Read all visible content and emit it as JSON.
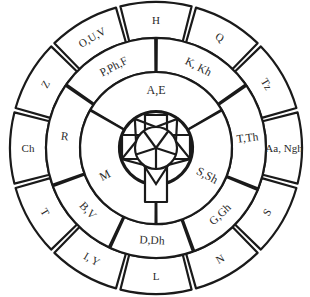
{
  "diagram": {
    "type": "concentric-letter-wheel",
    "center": {
      "x": 156,
      "y": 148
    },
    "colors": {
      "stroke": "#1a1a1a",
      "fill": "#ffffff",
      "text": "#2a2a2a"
    },
    "emblem": {
      "description": "cross over circle with pentagon-star pattern"
    },
    "inner_ring": {
      "segments": [
        {
          "label": "A,E"
        },
        {
          "label": "S,Sh"
        },
        {
          "label": "M"
        }
      ]
    },
    "middle_ring": {
      "segments": [
        {
          "label": "K, Kh"
        },
        {
          "label": "T,Th"
        },
        {
          "label": "G,Gh"
        },
        {
          "label": "D,Dh"
        },
        {
          "label": "B,V"
        },
        {
          "label": "R"
        },
        {
          "label": "P,Ph,F"
        }
      ]
    },
    "outer_ring": {
      "segments": [
        {
          "label": "H"
        },
        {
          "label": "Q"
        },
        {
          "label": "Tz"
        },
        {
          "label": "Aa, Ngh"
        },
        {
          "label": "S"
        },
        {
          "label": "N"
        },
        {
          "label": "L"
        },
        {
          "label": "I, Y"
        },
        {
          "label": "T"
        },
        {
          "label": "Ch"
        },
        {
          "label": "Z"
        },
        {
          "label": "O,U,V"
        }
      ]
    }
  }
}
